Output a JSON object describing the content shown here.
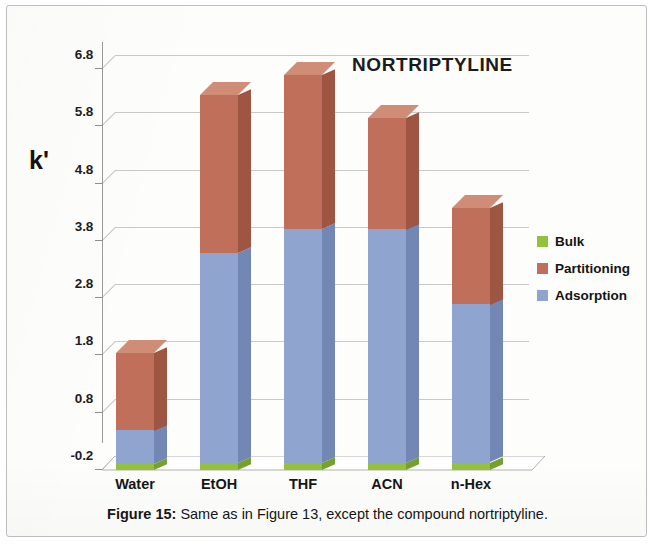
{
  "figure": {
    "caption_prefix": "Figure 15:",
    "caption_text": " Same as in Figure 13, except the compound nortriptyline."
  },
  "legend": {
    "items": [
      {
        "label": "Bulk",
        "color": "#93c13c"
      },
      {
        "label": "Partitioning",
        "color": "#c0705a"
      },
      {
        "label": "Adsorption",
        "color": "#8fa5d0"
      }
    ]
  },
  "colors": {
    "bulk": "#93c13c",
    "bulk_side": "#76a02c",
    "bulk_top": "#aace62",
    "partitioning": "#c0705a",
    "partitioning_side": "#9e5643",
    "partitioning_top": "#cf8c77",
    "adsorption": "#8fa5d0",
    "adsorption_side": "#7387b4",
    "adsorption_top": "#a8bbe0",
    "grid": "#b9b9b9",
    "axis": "#9b9b9b",
    "text": "#161616",
    "card_border": "#bdbdbd"
  },
  "chart_data": {
    "type": "bar",
    "subtype": "stacked-3d-column",
    "title": "NORTRIPTYLINE",
    "xlabel": "",
    "ylabel": "k'",
    "categories": [
      "Water",
      "EtOH",
      "THF",
      "ACN",
      "n-Hex"
    ],
    "series": [
      {
        "name": "Bulk",
        "color": "#93c13c",
        "values": [
          0.1,
          0.12,
          0.12,
          0.12,
          0.13
        ]
      },
      {
        "name": "Adsorption",
        "color": "#8fa5d0",
        "values": [
          0.59,
          3.66,
          4.08,
          4.08,
          2.76
        ]
      },
      {
        "name": "Partitioning",
        "color": "#c0705a",
        "values": [
          1.36,
          2.76,
          2.69,
          1.95,
          1.69
        ]
      }
    ],
    "stack_order": [
      "Bulk",
      "Adsorption",
      "Partitioning"
    ],
    "totals": [
      2.05,
      6.54,
      6.89,
      6.15,
      4.58
    ],
    "yticks": [
      -0.2,
      0.8,
      1.8,
      2.8,
      3.8,
      4.8,
      5.8,
      6.8
    ],
    "ytick_labels": [
      "-0.2",
      "0.8",
      "1.8",
      "2.8",
      "3.8",
      "4.8",
      "5.8",
      "6.8"
    ],
    "ylim": [
      -0.2,
      6.8
    ],
    "grid": true,
    "legend_position": "right"
  }
}
